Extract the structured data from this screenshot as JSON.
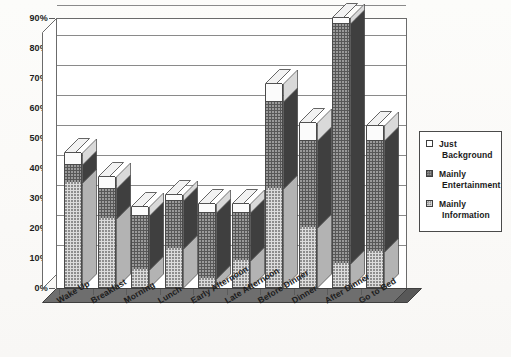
{
  "chart_data": {
    "type": "bar",
    "subtype": "stacked-column-3d",
    "title": "",
    "subtitle": "",
    "xlabel": "",
    "ylabel": "",
    "ylim": [
      0,
      90
    ],
    "ytick_step": 10,
    "grid": true,
    "legend_position": "right",
    "categories": [
      "Wake Up",
      "Breakfast",
      "Morning",
      "Lunch",
      "Early Afternoon",
      "Late Afternoon",
      "Before Dinner",
      "Dinner",
      "After Dinner",
      "Go to Bed"
    ],
    "ytick_labels": [
      "0%",
      "10%",
      "20%",
      "30%",
      "40%",
      "50%",
      "60%",
      "70%",
      "80%",
      "90%"
    ],
    "ytick_values": [
      0,
      10,
      20,
      30,
      40,
      50,
      60,
      70,
      80,
      90
    ],
    "series": [
      {
        "name": "Mainly Information",
        "key": "info",
        "values": [
          35,
          23,
          6,
          13,
          3,
          9,
          33,
          20,
          8,
          12
        ]
      },
      {
        "name": "Mainly Entertainment",
        "key": "ent",
        "values": [
          6,
          10,
          18,
          16,
          22,
          16,
          29,
          29,
          80,
          37
        ]
      },
      {
        "name": "Just Background",
        "key": "bg",
        "values": [
          4,
          4,
          3,
          2,
          3,
          3,
          6,
          6,
          2,
          5
        ]
      }
    ],
    "totals": [
      45,
      37,
      27,
      31,
      28,
      28,
      68,
      55,
      90,
      54
    ]
  },
  "legend": {
    "items": [
      {
        "swatch": "just-background-swatch",
        "line1": "Just",
        "line2": "Background"
      },
      {
        "swatch": "mainly-entertainment-swatch",
        "line1": "Mainly",
        "line2": "Entertainment"
      },
      {
        "swatch": "mainly-information-swatch",
        "line1": "Mainly",
        "line2": "Information"
      }
    ]
  },
  "colors": {
    "information": "#dcdcdc",
    "entertainment": "#575757",
    "background": "#fbfbfb",
    "axis": "#5a5a5a",
    "grid": "#8a8a8a",
    "floor": "#6e6e6e"
  }
}
